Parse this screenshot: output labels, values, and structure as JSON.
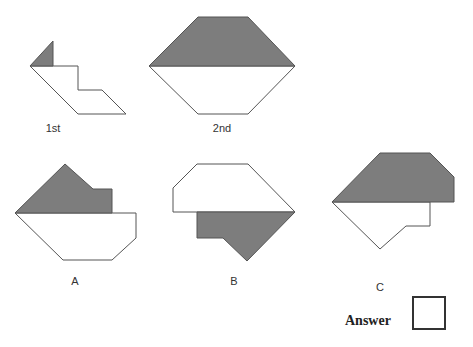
{
  "figures": {
    "first": {
      "label": "1st",
      "label_pos": [
        53,
        122
      ],
      "outline": "30,66 53,66 78,66 78,90 102,90 126,114 78,114",
      "shaded": "53,41 30,66 53,66"
    },
    "second": {
      "label": "2nd",
      "label_pos": [
        222,
        122
      ],
      "outline": "149,66 295,66 248,114 198,114",
      "shaded": "198,17 248,17 295,66 149,66"
    },
    "option_a": {
      "label": "A",
      "label_pos": [
        75,
        275
      ],
      "outline": "15,213 136,213 136,238 112,260 63,260",
      "shaded": "65,164 93,189 112,189 112,213 15,213"
    },
    "option_b": {
      "label": "B",
      "label_pos": [
        234,
        275
      ],
      "outline": "197,164 248,164 295,212 173,212 173,188",
      "shaded": "197,212 295,212 247,261 223,238 197,238"
    },
    "option_c": {
      "label": "C",
      "label_pos": [
        380,
        281
      ],
      "outline": "332,202 430,202 430,226 406,226 380,249",
      "shaded": "380,153 430,153 454,177 454,202 332,202"
    }
  },
  "answer": {
    "label": "Answer",
    "value": ""
  },
  "colors": {
    "shade": "#7d7d7d",
    "stroke": "#555555"
  }
}
